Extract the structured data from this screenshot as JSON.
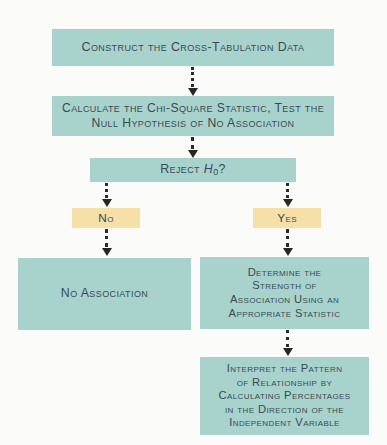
{
  "diagram": {
    "type": "flowchart",
    "background_color": "#fbfbf9",
    "process_box_color": "#a8d3cd",
    "decision_label_color": "#f7dfa8",
    "text_color": "#3a4a52",
    "connector_color": "#262626",
    "connector_style": "dotted-with-arrowhead"
  },
  "nodes": {
    "construct": {
      "label": "Construct the Cross-Tabulation Data",
      "kind": "process",
      "color": "#a8d3cd"
    },
    "calculate": {
      "label": "Calculate the Chi-Square Statistic, Test the\nNull Hypothesis of No Association",
      "kind": "process",
      "color": "#a8d3cd"
    },
    "decision": {
      "label_prefix": "Reject ",
      "label_symbol": "H",
      "label_subscript": "0",
      "label_suffix": "?",
      "label_plain": "Reject H0?",
      "kind": "decision",
      "color": "#a8d3cd"
    },
    "branch_no": {
      "label": "No",
      "kind": "branch-label",
      "color": "#f7dfa8"
    },
    "branch_yes": {
      "label": "Yes",
      "kind": "branch-label",
      "color": "#f7dfa8"
    },
    "no_association": {
      "label": "No Association",
      "kind": "terminal",
      "color": "#a8d3cd"
    },
    "determine": {
      "label": "Determine the\nStrength of\nAssociation Using an\nAppropriate Statistic",
      "kind": "process",
      "color": "#a8d3cd"
    },
    "interpret": {
      "label": "Interpret the Pattern\nof Relationship by\nCalculating Percentages\nin the Direction of the\nIndependent Variable",
      "kind": "process",
      "color": "#a8d3cd"
    }
  },
  "edges": [
    {
      "name": "construct-to-calculate",
      "from": "construct",
      "to": "calculate",
      "label": ""
    },
    {
      "name": "calculate-to-decision",
      "from": "calculate",
      "to": "decision",
      "label": ""
    },
    {
      "name": "decision-to-no",
      "from": "decision",
      "to": "branch_no",
      "label": ""
    },
    {
      "name": "decision-to-yes",
      "from": "decision",
      "to": "branch_yes",
      "label": ""
    },
    {
      "name": "no-to-no-association",
      "from": "branch_no",
      "to": "no_association",
      "label": ""
    },
    {
      "name": "yes-to-determine",
      "from": "branch_yes",
      "to": "determine",
      "label": ""
    },
    {
      "name": "determine-to-interpret",
      "from": "determine",
      "to": "interpret",
      "label": ""
    }
  ]
}
